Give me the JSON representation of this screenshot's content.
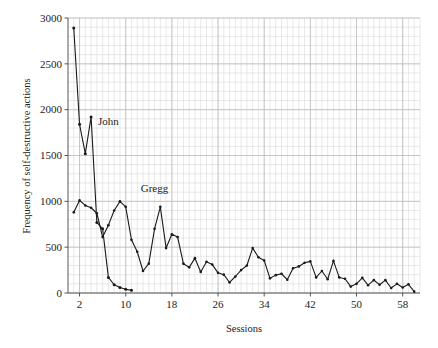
{
  "chart_data": {
    "type": "line",
    "title": "",
    "xlabel": "Sessions",
    "ylabel": "Frequency of self-destructive actions",
    "xlim": [
      0,
      61
    ],
    "ylim": [
      0,
      3000
    ],
    "xticks": [
      2,
      10,
      18,
      26,
      34,
      42,
      50,
      58
    ],
    "yticks": [
      0,
      500,
      1000,
      1500,
      2000,
      2500,
      3000
    ],
    "grid": "both-minor-and-major",
    "legend_position": "inline-annotations",
    "annotations": [
      {
        "text": "John",
        "x": 5.2,
        "y": 1830
      },
      {
        "text": "Gregg",
        "x": 12.6,
        "y": 1100
      }
    ],
    "series": [
      {
        "name": "John",
        "x": [
          1,
          2,
          3,
          4,
          5,
          6,
          7,
          8,
          9,
          10,
          11
        ],
        "values": [
          2890,
          1840,
          1520,
          1920,
          770,
          700,
          170,
          90,
          60,
          40,
          30
        ],
        "marker": "square-dot",
        "color": "#1a1a1a"
      },
      {
        "name": "Gregg",
        "x": [
          1,
          2,
          3,
          4,
          5,
          6,
          7,
          8,
          9,
          10,
          11,
          12,
          13,
          14,
          15,
          16,
          17,
          18,
          19,
          20,
          21,
          22,
          23,
          24,
          25,
          26,
          27,
          28,
          29,
          30,
          31,
          32,
          33,
          34,
          35,
          36,
          37,
          38,
          39,
          40,
          41,
          42,
          43,
          44,
          45,
          46,
          47,
          48,
          49,
          50,
          51,
          52,
          53,
          54,
          55,
          56,
          57,
          58,
          59,
          60
        ],
        "values": [
          880,
          1010,
          955,
          930,
          870,
          610,
          740,
          900,
          1000,
          940,
          580,
          450,
          240,
          320,
          700,
          940,
          490,
          640,
          610,
          320,
          280,
          380,
          230,
          340,
          310,
          220,
          200,
          115,
          180,
          250,
          300,
          490,
          390,
          355,
          160,
          195,
          210,
          145,
          270,
          290,
          330,
          345,
          170,
          240,
          150,
          350,
          170,
          155,
          70,
          100,
          165,
          85,
          140,
          90,
          140,
          55,
          100,
          60,
          95,
          15
        ],
        "marker": "dot",
        "color": "#1a1a1a"
      }
    ]
  },
  "axes": {
    "y_title": "Frequency of self-destructive actions",
    "x_title": "Sessions",
    "y_tick_labels": [
      "3000",
      "2500",
      "2000",
      "1500",
      "1000",
      "500",
      "0"
    ],
    "x_tick_labels": [
      "2",
      "10",
      "18",
      "26",
      "34",
      "42",
      "50",
      "58"
    ]
  },
  "labels": {
    "john": "John",
    "gregg": "Gregg"
  }
}
